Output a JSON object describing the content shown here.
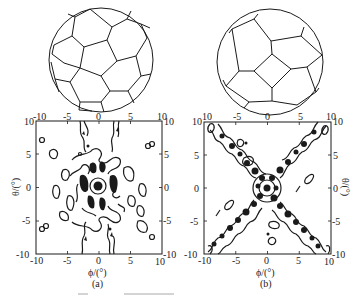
{
  "figure": {
    "panels": [
      {
        "id": "a",
        "caption": "(a)",
        "sphere": {
          "label": "truncated-icosahedron sphere (pentagon-centered view)",
          "center": [
            101,
            60
          ],
          "radius": 52
        },
        "plot": {
          "frame": {
            "x0": 36,
            "y0": 121,
            "x1": 162,
            "y1": 254
          },
          "xlabel": "ϕ/(°)",
          "ylabel": "θ/(°)",
          "ylabel_side": "left",
          "xticks": [
            "-10",
            "-5",
            "0",
            "5",
            "10"
          ],
          "yticks": [
            "10",
            "5",
            "0",
            "-5",
            "-10"
          ],
          "top_ticks": [
            "-10",
            "-5",
            "0",
            "5",
            "10"
          ],
          "right_ticks": [
            "10",
            "5",
            "0",
            "-5",
            "-10"
          ],
          "corner_left_top": "10",
          "corner_right_bottom": "-10"
        }
      },
      {
        "id": "b",
        "caption": "(b)",
        "sphere": {
          "label": "truncated-icosahedron sphere (hexagon-edge view)",
          "center": [
            270,
            62
          ],
          "radius": 53
        },
        "plot": {
          "frame": {
            "x0": 204,
            "y0": 122,
            "x1": 331,
            "y1": 254
          },
          "xlabel": "ϕ/(°)",
          "ylabel": "θ/(°)",
          "ylabel_side": "right",
          "xticks": [
            "-10",
            "-5",
            "0",
            "5",
            "10"
          ],
          "yticks": [
            "10",
            "5",
            "0",
            "-5",
            "-10"
          ],
          "top_ticks": [
            "10",
            "-5",
            "0",
            "5",
            "10"
          ],
          "right_ticks": [
            "10",
            "5",
            "0",
            "-5",
            "-10"
          ],
          "corner_left_top": "10",
          "corner_right_bottom": "-10"
        }
      }
    ],
    "colors": {
      "ink": "#1a1a1a",
      "background": "#ffffff"
    }
  }
}
